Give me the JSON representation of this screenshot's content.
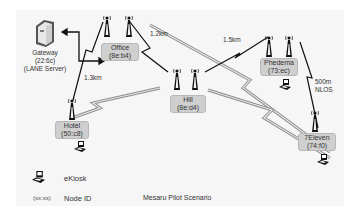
{
  "title": "Mesaru Pilot Scenario",
  "gateway": {
    "name": "Gateway",
    "id": "(22:6c)",
    "role": "(LANE Server)"
  },
  "nodes": [
    {
      "name": "Office",
      "id": "(8e:b4)"
    },
    {
      "name": "Hill",
      "id": "(8e:d4)"
    },
    {
      "name": "Phedema",
      "id": "(73:ec)"
    },
    {
      "name": "Hotel",
      "id": "(50:c8)"
    },
    {
      "name": "7Eleven",
      "id": "(74:f0)"
    }
  ],
  "links": [
    {
      "from": "Office",
      "to": "Hotel",
      "label": "1.3km"
    },
    {
      "from": "Office",
      "to": "Hill",
      "label": "1.2km"
    },
    {
      "from": "Hill",
      "to": "Phedema",
      "label": "1.5km"
    },
    {
      "from": "Phedema",
      "to": "7Eleven",
      "label": "500m",
      "label2": "NLOS"
    },
    {
      "from": "Office",
      "to": "7Eleven",
      "label": ""
    },
    {
      "from": "Hotel",
      "to": "Hill",
      "label": ""
    },
    {
      "from": "Hill",
      "to": "7Eleven",
      "label": ""
    }
  ],
  "legend": {
    "kiosk_label": "eKiosk",
    "node_id_symbol": "(xx:xx)",
    "node_id_label": "Node ID"
  },
  "colors": {
    "panel": "#f6f6f6",
    "node_box": "#cfcfcf",
    "wireless_dark": "#111111",
    "wireless_gray": "#9a9a9a"
  }
}
